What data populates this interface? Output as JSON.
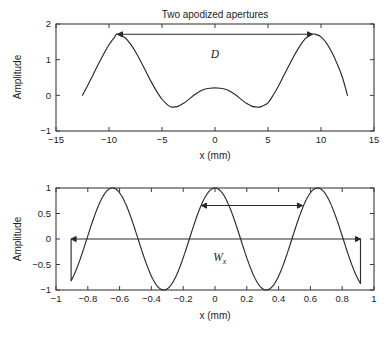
{
  "figure": {
    "background": "#ffffff",
    "line_color": "#2a2a2a",
    "axis_color": "#3b3b3b"
  },
  "chart_data": [
    {
      "id": "top",
      "type": "line",
      "title": "Two apodized apertures",
      "xlabel": "x (mm)",
      "ylabel": "Amplitude",
      "xlim": [
        -15,
        15
      ],
      "ylim": [
        -1,
        2
      ],
      "xticks": [
        -15,
        -10,
        -5,
        0,
        5,
        10,
        15
      ],
      "xticklabels": [
        "−15",
        "−10",
        "−5",
        "0",
        "5",
        "10",
        "15"
      ],
      "yticks": [
        -1,
        0,
        1,
        2
      ],
      "yticklabels": [
        "−1",
        "0",
        "1",
        "2"
      ],
      "grid": false,
      "legend": "none",
      "series": [
        {
          "name": "aperture-profile",
          "x": [
            -12.5,
            -12.0,
            -11.5,
            -11.0,
            -10.5,
            -10.0,
            -9.5,
            -9.3,
            -9.0,
            -8.5,
            -8.0,
            -7.5,
            -7.0,
            -6.5,
            -6.0,
            -5.5,
            -5.0,
            -4.5,
            -4.2,
            -4.0,
            -3.5,
            -3.0,
            -2.5,
            -2.0,
            -1.5,
            -1.0,
            -0.5,
            0.0,
            0.5,
            1.0,
            1.5,
            2.0,
            2.5,
            3.0,
            3.5,
            4.0,
            4.2,
            4.5,
            5.0,
            5.5,
            6.0,
            6.5,
            7.0,
            7.5,
            8.0,
            8.5,
            9.0,
            9.3,
            9.5,
            10.0,
            10.5,
            11.0,
            11.5,
            12.0,
            12.5
          ],
          "y": [
            0.0,
            0.28,
            0.58,
            0.88,
            1.16,
            1.42,
            1.62,
            1.71,
            1.7,
            1.62,
            1.45,
            1.22,
            0.95,
            0.66,
            0.37,
            0.11,
            -0.11,
            -0.26,
            -0.32,
            -0.33,
            -0.31,
            -0.23,
            -0.12,
            0.0,
            0.1,
            0.17,
            0.2,
            0.21,
            0.2,
            0.17,
            0.1,
            0.0,
            -0.12,
            -0.23,
            -0.31,
            -0.33,
            -0.33,
            -0.3,
            -0.21,
            0.01,
            0.27,
            0.56,
            0.85,
            1.13,
            1.38,
            1.58,
            1.7,
            1.72,
            1.71,
            1.64,
            1.47,
            1.22,
            0.9,
            0.52,
            0.0
          ]
        }
      ],
      "annotations": [
        {
          "name": "aperture-separation",
          "label": "D",
          "type": "double-arrow",
          "x_start": -9.2,
          "x_end": 9.2,
          "y": 1.71,
          "label_x": 0.0,
          "label_y": 1.05
        }
      ]
    },
    {
      "id": "bottom",
      "type": "line",
      "title": "",
      "xlabel": "x (mm)",
      "ylabel": "Amplitude",
      "xlim": [
        -1,
        1
      ],
      "ylim": [
        -1,
        1
      ],
      "xticks": [
        -1,
        -0.8,
        -0.6,
        -0.4,
        -0.2,
        0,
        0.2,
        0.4,
        0.6,
        0.8,
        1
      ],
      "xticklabels": [
        "−1",
        "−0.8",
        "−0.6",
        "−0.4",
        "−0.2",
        "0",
        "0.2",
        "0.4",
        "0.6",
        "0.8",
        "1"
      ],
      "yticks": [
        -1,
        -0.5,
        0,
        0.5,
        1
      ],
      "yticklabels": [
        "−1",
        "−0.5",
        "0",
        "0.5",
        "1"
      ],
      "grid": false,
      "legend": "none",
      "series": [
        {
          "name": "sinusoidal-weighting",
          "comment": "cosine of period ~0.645 mm, truncated at +/-0.91 with drop-to-zero tails",
          "period": 0.645,
          "phase_peaks": [
            -0.635,
            0.0,
            0.64
          ],
          "x_truncate": [
            -0.905,
            0.915
          ]
        }
      ],
      "annotations": [
        {
          "name": "wavelength-span",
          "label": "Wx",
          "label_main": "W",
          "label_sub": "x",
          "type": "double-arrow",
          "x_start": -0.085,
          "x_end": 0.55,
          "y": 0.655,
          "label_x": 0.03,
          "label_y": -0.44
        },
        {
          "name": "full-aperture-span",
          "type": "double-arrow",
          "x_start": -0.905,
          "x_end": 0.915,
          "y": 0.0
        }
      ]
    }
  ]
}
